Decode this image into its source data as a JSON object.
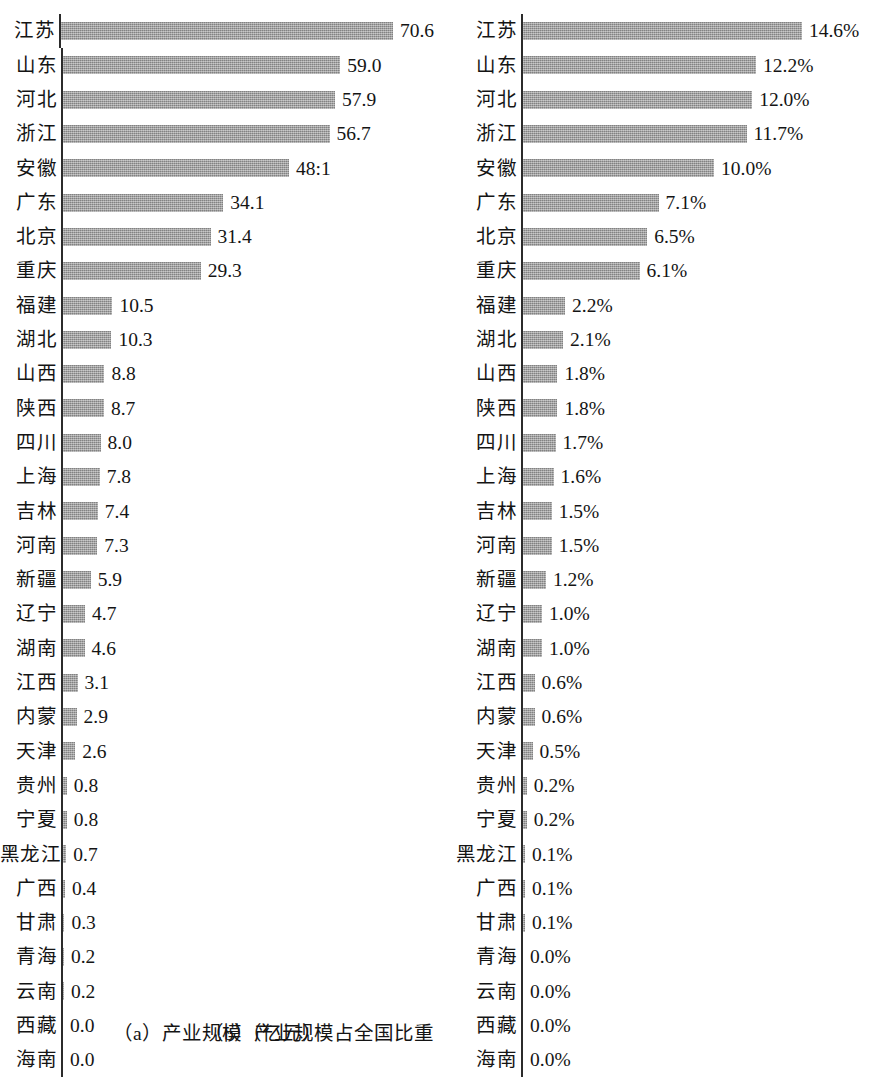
{
  "figure": {
    "categories": [
      "江苏",
      "山东",
      "河北",
      "浙江",
      "安徽",
      "广东",
      "北京",
      "重庆",
      "福建",
      "湖北",
      "山西",
      "陕西",
      "四川",
      "上海",
      "吉林",
      "河南",
      "新疆",
      "辽宁",
      "湖南",
      "江西",
      "内蒙",
      "天津",
      "贵州",
      "宁夏",
      "黑龙江",
      "广西",
      "甘肃",
      "青海",
      "云南",
      "西藏",
      "海南"
    ],
    "bar_color": "#9d9d9d",
    "axis_color": "#2b2b2b"
  },
  "panel_a": {
    "caption": "（a）产业规模（亿元）",
    "value_labels": [
      "70.6",
      "59.0",
      "57.9",
      "56.7",
      "48:1",
      "34.1",
      "31.4",
      "29.3",
      "10.5",
      "10.3",
      "8.8",
      "8.7",
      "8.0",
      "7.8",
      "7.4",
      "7.3",
      "5.9",
      "4.7",
      "4.6",
      "3.1",
      "2.9",
      "2.6",
      "0.8",
      "0.8",
      "0.7",
      "0.4",
      "0.3",
      "0.2",
      "0.2",
      "0.0",
      "0.0"
    ]
  },
  "panel_b": {
    "caption": "（b）产业规模占全国比重",
    "value_labels": [
      "14.6%",
      "12.2%",
      "12.0%",
      "11.7%",
      "10.0%",
      "7.1%",
      "6.5%",
      "6.1%",
      "2.2%",
      "2.1%",
      "1.8%",
      "1.8%",
      "1.7%",
      "1.6%",
      "1.5%",
      "1.5%",
      "1.2%",
      "1.0%",
      "1.0%",
      "0.6%",
      "0.6%",
      "0.5%",
      "0.2%",
      "0.2%",
      "0.1%",
      "0.1%",
      "0.1%",
      "0.0%",
      "0.0%",
      "0.0%",
      "0.0%"
    ]
  },
  "chart_data": [
    {
      "type": "bar",
      "orientation": "horizontal",
      "panel": "a",
      "title": "（a）产业规模（亿元）",
      "xlabel": "产业规模（亿元）",
      "ylabel": "",
      "grid": false,
      "legend": "none",
      "xlim": [
        0,
        70.6
      ],
      "px_per_unit": 4.7,
      "categories": [
        "江苏",
        "山东",
        "河北",
        "浙江",
        "安徽",
        "广东",
        "北京",
        "重庆",
        "福建",
        "湖北",
        "山西",
        "陕西",
        "四川",
        "上海",
        "吉林",
        "河南",
        "新疆",
        "辽宁",
        "湖南",
        "江西",
        "内蒙",
        "天津",
        "贵州",
        "宁夏",
        "黑龙江",
        "广西",
        "甘肃",
        "青海",
        "云南",
        "西藏",
        "海南"
      ],
      "values": [
        70.6,
        59.0,
        57.9,
        56.7,
        48.1,
        34.1,
        31.4,
        29.3,
        10.5,
        10.3,
        8.8,
        8.7,
        8.0,
        7.8,
        7.4,
        7.3,
        5.9,
        4.7,
        4.6,
        3.1,
        2.9,
        2.6,
        0.8,
        0.8,
        0.7,
        0.4,
        0.3,
        0.2,
        0.2,
        0.0,
        0.0
      ],
      "data_labels": [
        "70.6",
        "59.0",
        "57.9",
        "56.7",
        "48:1",
        "34.1",
        "31.4",
        "29.3",
        "10.5",
        "10.3",
        "8.8",
        "8.7",
        "8.0",
        "7.8",
        "7.4",
        "7.3",
        "5.9",
        "4.7",
        "4.6",
        "3.1",
        "2.9",
        "2.6",
        "0.8",
        "0.8",
        "0.7",
        "0.4",
        "0.3",
        "0.2",
        "0.2",
        "0.0",
        "0.0"
      ],
      "notes": "安徽 data label is printed as '48:1' in the scan (decimal point rendered raised); the value is 48.1."
    },
    {
      "type": "bar",
      "orientation": "horizontal",
      "panel": "b",
      "title": "（b）产业规模占全国比重",
      "xlabel": "产业规模占全国比重",
      "ylabel": "",
      "grid": false,
      "legend": "none",
      "xlim": [
        0,
        14.6
      ],
      "unit": "%",
      "px_per_unit": 19.1,
      "categories": [
        "江苏",
        "山东",
        "河北",
        "浙江",
        "安徽",
        "广东",
        "北京",
        "重庆",
        "福建",
        "湖北",
        "山西",
        "陕西",
        "四川",
        "上海",
        "吉林",
        "河南",
        "新疆",
        "辽宁",
        "湖南",
        "江西",
        "内蒙",
        "天津",
        "贵州",
        "宁夏",
        "黑龙江",
        "广西",
        "甘肃",
        "青海",
        "云南",
        "西藏",
        "海南"
      ],
      "values": [
        14.6,
        12.2,
        12.0,
        11.7,
        10.0,
        7.1,
        6.5,
        6.1,
        2.2,
        2.1,
        1.8,
        1.8,
        1.7,
        1.6,
        1.5,
        1.5,
        1.2,
        1.0,
        1.0,
        0.6,
        0.6,
        0.5,
        0.2,
        0.2,
        0.1,
        0.1,
        0.1,
        0.0,
        0.0,
        0.0,
        0.0
      ],
      "data_labels": [
        "14.6%",
        "12.2%",
        "12.0%",
        "11.7%",
        "10.0%",
        "7.1%",
        "6.5%",
        "6.1%",
        "2.2%",
        "2.1%",
        "1.8%",
        "1.8%",
        "1.7%",
        "1.6%",
        "1.5%",
        "1.5%",
        "1.2%",
        "1.0%",
        "1.0%",
        "0.6%",
        "0.6%",
        "0.5%",
        "0.2%",
        "0.2%",
        "0.1%",
        "0.1%",
        "0.1%",
        "0.0%",
        "0.0%",
        "0.0%",
        "0.0%"
      ]
    }
  ]
}
